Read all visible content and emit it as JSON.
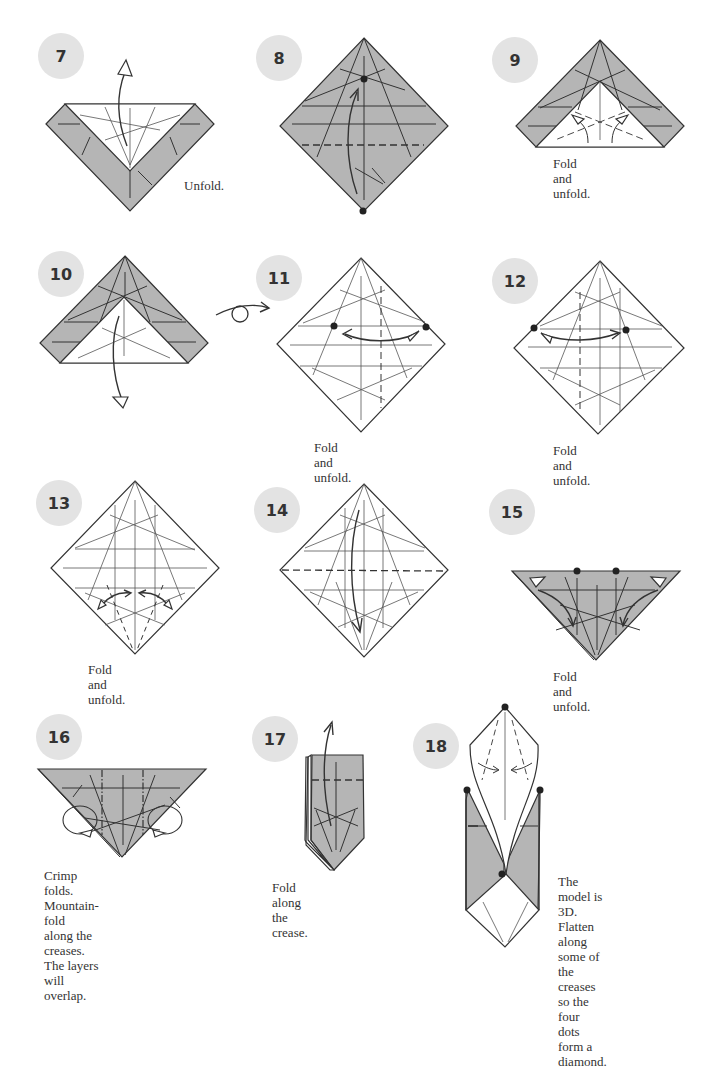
{
  "page": {
    "type": "origami instruction diagrams",
    "colors": {
      "paper_colored_side": "#b5b5b5",
      "paper_white_side": "#ffffff",
      "badge": "#e3e3e3",
      "line": "#333333"
    }
  },
  "steps": [
    {
      "number": "7",
      "caption": "Unfold."
    },
    {
      "number": "8",
      "caption": ""
    },
    {
      "number": "9",
      "caption": "Fold and unfold."
    },
    {
      "number": "10",
      "caption": ""
    },
    {
      "number": "11",
      "caption": "Fold and unfold."
    },
    {
      "number": "12",
      "caption": "Fold and unfold."
    },
    {
      "number": "13",
      "caption": "Fold and unfold."
    },
    {
      "number": "14",
      "caption": ""
    },
    {
      "number": "15",
      "caption": "Fold and unfold."
    },
    {
      "number": "16",
      "caption": "Crimp folds. Mountain-fold\nalong the creases. The layers\nwill overlap."
    },
    {
      "number": "17",
      "caption": "Fold along the crease."
    },
    {
      "number": "18",
      "caption": "The model is 3D.\nFlatten along some of\nthe creases so the four\ndots form a diamond."
    }
  ],
  "symbols": {
    "turn_over": "turn-over-icon",
    "valley_fold": "dashed line",
    "mountain_fold": "dash-dot line",
    "reference_point": "dot"
  }
}
